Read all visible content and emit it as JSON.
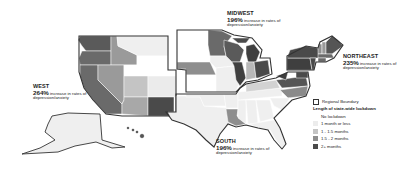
{
  "map": {
    "type": "choropleth",
    "subject": "US regions by length of statewide lockdown",
    "regions": [
      {
        "key": "west",
        "name": "WEST",
        "percent": "264%",
        "text": "increase in rates of depression/anxiety"
      },
      {
        "key": "midwest",
        "name": "MIDWEST",
        "percent": "196%",
        "text": "increase in rates of depression/anxiety"
      },
      {
        "key": "northeast",
        "name": "NORTHEAST",
        "percent": "235%",
        "text": "increase in rates of depression/anxiety"
      },
      {
        "key": "south",
        "name": "SOUTH",
        "percent": "196%",
        "text": "increase in rates of depression/anxiety"
      }
    ]
  },
  "legend": {
    "boundary_label": "Regional Boundary",
    "title": "Length of state-wide lockdown",
    "items": [
      {
        "label": "No lockdown",
        "color": "#ffffff"
      },
      {
        "label": "1 month or less",
        "color": "#ececec"
      },
      {
        "label": "1 - 1.5 months",
        "color": "#c4c4c4"
      },
      {
        "label": "1.5 - 2 months",
        "color": "#8e8e8e"
      },
      {
        "label": "2+ months",
        "color": "#4a4a4a"
      }
    ]
  },
  "colors": {
    "none": "#ffffff",
    "le1": "#ececec",
    "m1_15": "#c4c4c4",
    "m15_2": "#8e8e8e",
    "m2plus": "#4a4a4a",
    "border": "#333333"
  }
}
